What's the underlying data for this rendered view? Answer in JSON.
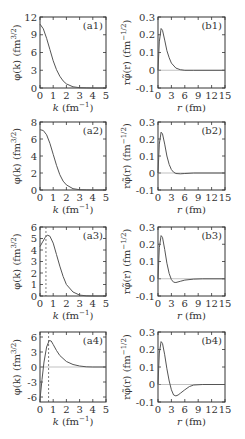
{
  "chart_data": [
    {
      "id": "a1",
      "type": "line",
      "tag": "(a1)",
      "xlabel": "k (fm⁻¹)",
      "ylabel": "φ(k) (fm^3/2)",
      "xlim": [
        0,
        5
      ],
      "ylim": [
        0,
        12
      ],
      "xticks": [
        0,
        1,
        2,
        3,
        4,
        5
      ],
      "yticks": [
        0,
        3,
        6,
        9,
        12
      ],
      "x": [
        0,
        0.25,
        0.5,
        0.75,
        1,
        1.25,
        1.5,
        1.75,
        2,
        2.5,
        3,
        3.5,
        4,
        5
      ],
      "y": [
        10.8,
        10,
        8.4,
        6.5,
        4.6,
        3.1,
        2.0,
        1.2,
        0.7,
        0.2,
        0.05,
        0.01,
        0,
        0
      ],
      "vline": null,
      "zero_line": false
    },
    {
      "id": "b1",
      "type": "line",
      "tag": "(b1)",
      "xlabel": "r (fm)",
      "ylabel": "rφ̃(r) (fm^-1/2)",
      "xlim": [
        0,
        15
      ],
      "ylim": [
        -0.1,
        0.3
      ],
      "xticks": [
        0,
        3,
        6,
        9,
        12,
        15
      ],
      "yticks": [
        -0.1,
        0,
        0.1,
        0.2,
        0.3
      ],
      "x": [
        0,
        0.3,
        0.7,
        1.0,
        1.5,
        2,
        2.5,
        3,
        4,
        5,
        6,
        8,
        15
      ],
      "y": [
        0,
        0.16,
        0.235,
        0.225,
        0.17,
        0.11,
        0.07,
        0.04,
        0.012,
        0.003,
        0,
        0,
        0
      ],
      "vline": null,
      "zero_line": true
    },
    {
      "id": "a2",
      "type": "line",
      "tag": "(a2)",
      "xlabel": "k (fm⁻¹)",
      "ylabel": "φ(k) (fm^3/2)",
      "xlim": [
        0,
        5
      ],
      "ylim": [
        0,
        8
      ],
      "xticks": [
        0,
        1,
        2,
        3,
        4,
        5
      ],
      "yticks": [
        0,
        2,
        4,
        6,
        8
      ],
      "x": [
        0,
        0.25,
        0.5,
        0.75,
        1,
        1.25,
        1.5,
        1.75,
        2,
        2.5,
        3,
        3.5,
        4,
        5
      ],
      "y": [
        7.1,
        7.0,
        6.5,
        5.5,
        4.2,
        2.9,
        1.8,
        1.05,
        0.6,
        0.15,
        0.03,
        0.01,
        0,
        0
      ],
      "vline": null,
      "zero_line": false
    },
    {
      "id": "b2",
      "type": "line",
      "tag": "(b2)",
      "xlabel": "r (fm)",
      "ylabel": "rφ̃(r) (fm^-1/2)",
      "xlim": [
        0,
        15
      ],
      "ylim": [
        -0.1,
        0.3
      ],
      "xticks": [
        0,
        3,
        6,
        9,
        12,
        15
      ],
      "yticks": [
        -0.1,
        0,
        0.1,
        0.2,
        0.3
      ],
      "x": [
        0,
        0.3,
        0.7,
        1.0,
        1.5,
        2,
        2.5,
        3,
        3.5,
        4,
        5,
        6,
        8,
        15
      ],
      "y": [
        0,
        0.17,
        0.24,
        0.23,
        0.17,
        0.1,
        0.05,
        0.02,
        0.005,
        -0.003,
        -0.005,
        -0.003,
        0,
        0
      ],
      "vline": null,
      "zero_line": true
    },
    {
      "id": "a3",
      "type": "line",
      "tag": "(a3)",
      "xlabel": "k (fm⁻¹)",
      "ylabel": "φ(k) (fm^3/2)",
      "xlim": [
        0,
        5
      ],
      "ylim": [
        0,
        6
      ],
      "xticks": [
        0,
        1,
        2,
        3,
        4,
        5
      ],
      "yticks": [
        0,
        1,
        2,
        3,
        4,
        5,
        6
      ],
      "x": [
        0,
        0.2,
        0.4,
        0.55,
        0.75,
        1,
        1.25,
        1.5,
        1.75,
        2,
        2.5,
        3,
        3.5,
        4,
        5
      ],
      "y": [
        4.3,
        4.7,
        5.1,
        5.3,
        5.2,
        4.6,
        3.6,
        2.6,
        1.7,
        1.0,
        0.35,
        0.08,
        0.02,
        0,
        0
      ],
      "vline": 0.45,
      "zero_line": false
    },
    {
      "id": "b3",
      "type": "line",
      "tag": "(b3)",
      "xlabel": "r (fm)",
      "ylabel": "rφ̃(r) (fm^-1/2)",
      "xlim": [
        0,
        15
      ],
      "ylim": [
        -0.1,
        0.3
      ],
      "xticks": [
        0,
        3,
        6,
        9,
        12,
        15
      ],
      "yticks": [
        -0.1,
        0,
        0.1,
        0.2,
        0.3
      ],
      "x": [
        0,
        0.3,
        0.7,
        1.0,
        1.5,
        2,
        2.5,
        3,
        3.5,
        4,
        5,
        6,
        8,
        10,
        15
      ],
      "y": [
        0,
        0.18,
        0.25,
        0.24,
        0.17,
        0.09,
        0.03,
        -0.005,
        -0.02,
        -0.022,
        -0.015,
        -0.008,
        -0.002,
        0,
        0
      ],
      "vline": null,
      "zero_line": true
    },
    {
      "id": "a4",
      "type": "line",
      "tag": "(a4)",
      "xlabel": "k (fm⁻¹)",
      "ylabel": "φ(k) (fm^3/2)",
      "xlim": [
        0,
        5
      ],
      "ylim": [
        -7,
        7
      ],
      "xticks": [
        0,
        1,
        2,
        3,
        4,
        5
      ],
      "yticks": [
        -6,
        -3,
        0,
        3,
        6
      ],
      "x": [
        0,
        0.15,
        0.3,
        0.5,
        0.7,
        0.85,
        1.0,
        1.25,
        1.5,
        2,
        2.5,
        3,
        3.5,
        4,
        5
      ],
      "y": [
        -6.5,
        -2.5,
        1.0,
        4.0,
        5.3,
        5.2,
        4.5,
        3.3,
        2.3,
        1.1,
        0.5,
        0.2,
        0.05,
        0,
        0
      ],
      "vline": 0.65,
      "zero_line": true
    },
    {
      "id": "b4",
      "type": "line",
      "tag": "(b4)",
      "xlabel": "r (fm)",
      "ylabel": "rφ̃(r) (fm^-1/2)",
      "xlim": [
        0,
        15
      ],
      "ylim": [
        -0.1,
        0.3
      ],
      "xticks": [
        0,
        3,
        6,
        9,
        12,
        15
      ],
      "yticks": [
        -0.1,
        0,
        0.1,
        0.2,
        0.3
      ],
      "x": [
        0,
        0.3,
        0.7,
        1.0,
        1.5,
        2,
        2.5,
        3,
        3.5,
        4,
        4.5,
        5,
        6,
        7,
        8,
        10,
        15
      ],
      "y": [
        0,
        0.18,
        0.245,
        0.235,
        0.17,
        0.09,
        0.02,
        -0.03,
        -0.06,
        -0.065,
        -0.06,
        -0.05,
        -0.03,
        -0.012,
        -0.003,
        0,
        0
      ],
      "vline": null,
      "zero_line": true
    }
  ],
  "labels": {
    "k_axis": "k (fm",
    "k_exp": "−1",
    "r_axis": "r (fm)",
    "phi_k": "φ(k) (fm",
    "phi_k_exp": "3/2",
    "phi_r": "rφ̃(r) (fm",
    "phi_r_exp": "−1/2"
  }
}
